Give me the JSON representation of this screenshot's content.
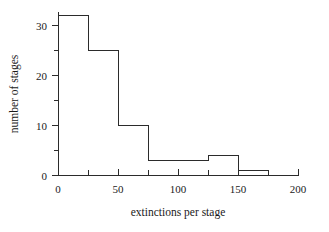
{
  "chart_data": {
    "type": "bar",
    "title": "",
    "xlabel": "extinctions per stage",
    "ylabel": "number of stages",
    "bin_width": 25,
    "bin_edges": [
      0,
      25,
      50,
      75,
      100,
      125,
      150,
      175,
      200
    ],
    "categories": [
      "0-25",
      "25-50",
      "50-75",
      "75-100",
      "100-125",
      "125-150",
      "150-175",
      "175-200"
    ],
    "values": [
      32,
      25,
      10,
      3,
      3,
      4,
      1,
      0
    ],
    "xlim": [
      0,
      200
    ],
    "ylim": [
      0,
      33
    ],
    "x_ticks_major": [
      0,
      50,
      100,
      150,
      200
    ],
    "x_ticks_minor": [
      25,
      75,
      125,
      175
    ],
    "x_tick_labels": [
      "0",
      "50",
      "100",
      "150",
      "200"
    ],
    "y_ticks_major": [
      0,
      10,
      20,
      30
    ],
    "y_ticks_minor": [
      5,
      15,
      25
    ],
    "y_tick_labels": [
      "0",
      "10",
      "20",
      "30"
    ],
    "grid": false,
    "legend": false,
    "bar_fill": "none",
    "bar_stroke": "#2b2b2b",
    "background": "#ffffff"
  },
  "axis": {
    "x_title": "extinctions per stage",
    "y_title": "number of stages",
    "x_title_italic_word": "per"
  }
}
